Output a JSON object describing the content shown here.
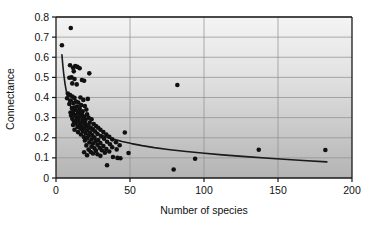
{
  "chart_data": {
    "type": "scatter",
    "title": "",
    "xlabel": "Number of species",
    "ylabel": "Connectance",
    "xlim": [
      0,
      200
    ],
    "ylim": [
      0,
      0.8
    ],
    "xticks": [
      "0",
      "50",
      "100",
      "150",
      "200"
    ],
    "xtick_values": [
      0,
      50,
      100,
      150,
      200
    ],
    "yticks": [
      "0",
      "0.1",
      "0.2",
      "0.3",
      "0.4",
      "0.5",
      "0.6",
      "0.7",
      "0.8"
    ],
    "ytick_values": [
      0,
      0.1,
      0.2,
      0.3,
      0.4,
      0.5,
      0.6,
      0.7,
      0.8
    ],
    "grid": "horizontal-and-vertical",
    "legend": "none",
    "marker": "filled-circle",
    "marker_color": "#101010",
    "marker_size_px": 4.6,
    "plot_background_top": "#f2f2f2",
    "plot_background_bottom": "#b9b9b9",
    "gridline_color": "#8c8c8c",
    "axis_color": "#1a1a1a",
    "curve_color": "#1a1a1a",
    "curve_label": "fitted power-law decay",
    "curve_points": [
      [
        4,
        0.612
      ],
      [
        4.6,
        0.56
      ],
      [
        5.3,
        0.512
      ],
      [
        6.1,
        0.468
      ],
      [
        7.0,
        0.43
      ],
      [
        8.0,
        0.398
      ],
      [
        9.2,
        0.369
      ],
      [
        10.5,
        0.344
      ],
      [
        12.0,
        0.322
      ],
      [
        13.7,
        0.302
      ],
      [
        15.6,
        0.285
      ],
      [
        17.8,
        0.269
      ],
      [
        20.3,
        0.254
      ],
      [
        23.2,
        0.24
      ],
      [
        26.4,
        0.227
      ],
      [
        30.1,
        0.215
      ],
      [
        34.4,
        0.203
      ],
      [
        39.2,
        0.192
      ],
      [
        44.7,
        0.181
      ],
      [
        51.0,
        0.171
      ],
      [
        58.2,
        0.161
      ],
      [
        66.4,
        0.151
      ],
      [
        75.7,
        0.142
      ],
      [
        86.4,
        0.133
      ],
      [
        98.5,
        0.124
      ],
      [
        112.4,
        0.115
      ],
      [
        128.2,
        0.106
      ],
      [
        146.3,
        0.097
      ],
      [
        166.9,
        0.087
      ],
      [
        183.0,
        0.08
      ]
    ],
    "points": [
      [
        4.0,
        0.66
      ],
      [
        10.0,
        0.745
      ],
      [
        9.5,
        0.56
      ],
      [
        11.5,
        0.548
      ],
      [
        13.0,
        0.556
      ],
      [
        14.5,
        0.552
      ],
      [
        12.0,
        0.53
      ],
      [
        16.0,
        0.545
      ],
      [
        22.5,
        0.52
      ],
      [
        9.0,
        0.498
      ],
      [
        10.5,
        0.5
      ],
      [
        12.5,
        0.492
      ],
      [
        17.5,
        0.487
      ],
      [
        19.0,
        0.483
      ],
      [
        11.0,
        0.47
      ],
      [
        14.0,
        0.465
      ],
      [
        82.0,
        0.462
      ],
      [
        8.0,
        0.42
      ],
      [
        9.5,
        0.412
      ],
      [
        11.0,
        0.405
      ],
      [
        12.5,
        0.398
      ],
      [
        7.5,
        0.396
      ],
      [
        16.5,
        0.4
      ],
      [
        21.5,
        0.393
      ],
      [
        18.5,
        0.388
      ],
      [
        10.0,
        0.385
      ],
      [
        13.5,
        0.38
      ],
      [
        15.0,
        0.375
      ],
      [
        11.8,
        0.372
      ],
      [
        9.0,
        0.368
      ],
      [
        17.0,
        0.362
      ],
      [
        19.5,
        0.358
      ],
      [
        14.2,
        0.355
      ],
      [
        12.2,
        0.35
      ],
      [
        10.8,
        0.347
      ],
      [
        16.0,
        0.344
      ],
      [
        20.5,
        0.34
      ],
      [
        13.0,
        0.338
      ],
      [
        15.5,
        0.334
      ],
      [
        18.0,
        0.331
      ],
      [
        11.5,
        0.328
      ],
      [
        9.8,
        0.325
      ],
      [
        14.8,
        0.322
      ],
      [
        17.5,
        0.319
      ],
      [
        21.0,
        0.316
      ],
      [
        12.8,
        0.313
      ],
      [
        10.2,
        0.31
      ],
      [
        16.2,
        0.308
      ],
      [
        19.0,
        0.305
      ],
      [
        13.8,
        0.302
      ],
      [
        22.0,
        0.3
      ],
      [
        15.0,
        0.297
      ],
      [
        11.0,
        0.295
      ],
      [
        17.8,
        0.292
      ],
      [
        20.0,
        0.289
      ],
      [
        14.0,
        0.286
      ],
      [
        24.0,
        0.292
      ],
      [
        12.0,
        0.283
      ],
      [
        18.5,
        0.28
      ],
      [
        16.0,
        0.277
      ],
      [
        22.8,
        0.275
      ],
      [
        13.2,
        0.272
      ],
      [
        19.8,
        0.269
      ],
      [
        15.8,
        0.266
      ],
      [
        25.5,
        0.268
      ],
      [
        11.5,
        0.263
      ],
      [
        21.5,
        0.26
      ],
      [
        17.0,
        0.257
      ],
      [
        27.0,
        0.258
      ],
      [
        14.5,
        0.254
      ],
      [
        23.5,
        0.251
      ],
      [
        19.0,
        0.248
      ],
      [
        28.5,
        0.25
      ],
      [
        16.5,
        0.245
      ],
      [
        25.0,
        0.242
      ],
      [
        12.5,
        0.24
      ],
      [
        21.0,
        0.237
      ],
      [
        30.0,
        0.24
      ],
      [
        18.0,
        0.234
      ],
      [
        26.5,
        0.231
      ],
      [
        14.8,
        0.228
      ],
      [
        23.0,
        0.225
      ],
      [
        32.0,
        0.228
      ],
      [
        46.5,
        0.226
      ],
      [
        20.0,
        0.222
      ],
      [
        28.0,
        0.219
      ],
      [
        16.8,
        0.216
      ],
      [
        24.5,
        0.213
      ],
      [
        34.0,
        0.216
      ],
      [
        22.0,
        0.21
      ],
      [
        30.5,
        0.207
      ],
      [
        18.8,
        0.204
      ],
      [
        26.0,
        0.201
      ],
      [
        36.0,
        0.205
      ],
      [
        21.0,
        0.198
      ],
      [
        32.5,
        0.195
      ],
      [
        24.0,
        0.192
      ],
      [
        28.5,
        0.189
      ],
      [
        19.5,
        0.186
      ],
      [
        38.0,
        0.192
      ],
      [
        26.8,
        0.183
      ],
      [
        34.5,
        0.18
      ],
      [
        22.5,
        0.177
      ],
      [
        30.0,
        0.174
      ],
      [
        40.5,
        0.178
      ],
      [
        25.0,
        0.171
      ],
      [
        36.5,
        0.168
      ],
      [
        28.0,
        0.165
      ],
      [
        20.5,
        0.162
      ],
      [
        32.0,
        0.159
      ],
      [
        43.0,
        0.163
      ],
      [
        24.0,
        0.156
      ],
      [
        38.0,
        0.153
      ],
      [
        29.5,
        0.15
      ],
      [
        26.0,
        0.147
      ],
      [
        34.0,
        0.144
      ],
      [
        22.0,
        0.141
      ],
      [
        31.0,
        0.138
      ],
      [
        41.0,
        0.142
      ],
      [
        27.0,
        0.135
      ],
      [
        36.0,
        0.132
      ],
      [
        23.5,
        0.129
      ],
      [
        33.0,
        0.126
      ],
      [
        137.0,
        0.14
      ],
      [
        182.0,
        0.139
      ],
      [
        49.0,
        0.124
      ],
      [
        94.0,
        0.096
      ],
      [
        21.0,
        0.113
      ],
      [
        30.0,
        0.11
      ],
      [
        38.5,
        0.104
      ],
      [
        43.5,
        0.098
      ],
      [
        34.5,
        0.063
      ],
      [
        79.5,
        0.042
      ],
      [
        41.5,
        0.1
      ],
      [
        28.0,
        0.118
      ],
      [
        25.0,
        0.122
      ],
      [
        19.0,
        0.128
      ]
    ]
  },
  "axis": {
    "xlabel": "Number of species",
    "ylabel": "Connectance"
  }
}
